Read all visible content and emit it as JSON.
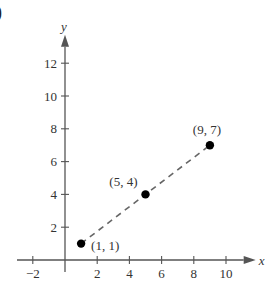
{
  "part_label": ")",
  "chart_data": {
    "type": "scatter",
    "title": "",
    "xlabel": "x",
    "ylabel": "y",
    "xlim": [
      -3,
      11.5
    ],
    "ylim": [
      0,
      13.5
    ],
    "grid": false,
    "x_ticks": [
      -2,
      2,
      4,
      6,
      8,
      10
    ],
    "y_ticks": [
      2,
      4,
      6,
      8,
      10,
      12
    ],
    "points": [
      {
        "x": 1,
        "y": 1,
        "label": "(1, 1)"
      },
      {
        "x": 5,
        "y": 4,
        "label": "(5, 4)"
      },
      {
        "x": 9,
        "y": 7,
        "label": "(9, 7)"
      }
    ],
    "line": {
      "style": "dashed",
      "from": [
        1,
        1
      ],
      "to": [
        9,
        7
      ]
    },
    "colors": {
      "axis": "#555555",
      "points": "#000000",
      "line": "#666666"
    }
  }
}
